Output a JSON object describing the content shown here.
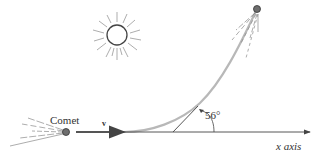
{
  "diagram": {
    "labels": {
      "comet": "Comet",
      "velocity": "v",
      "angle": "56°",
      "axis": "x axis"
    },
    "angle_degrees": 56,
    "colors": {
      "line": "#333333",
      "trajectory": "#b8b8b8",
      "comet_fill": "#6e6e6e",
      "rays": "#8a8a8a"
    }
  }
}
